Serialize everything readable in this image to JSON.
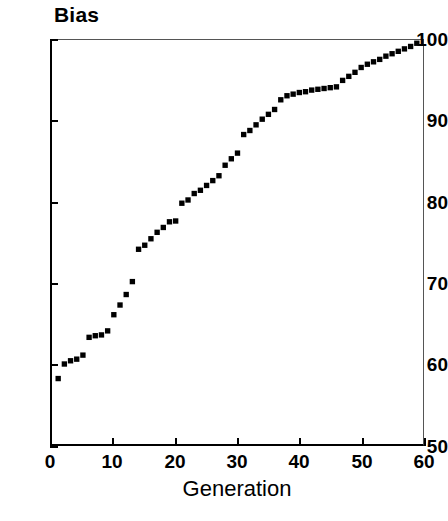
{
  "chart_data": {
    "type": "scatter",
    "title": "Bias",
    "xlabel": "Generation",
    "ylabel": "Bias",
    "xlim": [
      0,
      60
    ],
    "ylim": [
      50,
      100
    ],
    "xticks": [
      0,
      10,
      20,
      30,
      40,
      50,
      60
    ],
    "yticks": [
      50,
      60,
      70,
      80,
      90,
      100
    ],
    "grid": false,
    "legend": null,
    "marker": "square",
    "marker_color": "#000000",
    "series": [
      {
        "name": "Bias",
        "x": [
          1,
          2,
          3,
          4,
          5,
          6,
          7,
          8,
          9,
          10,
          11,
          12,
          13,
          14,
          15,
          16,
          17,
          18,
          19,
          20,
          21,
          22,
          23,
          24,
          25,
          26,
          27,
          28,
          29,
          30,
          31,
          32,
          33,
          34,
          35,
          36,
          37,
          38,
          39,
          40,
          41,
          42,
          43,
          44,
          45,
          46,
          47,
          48,
          49,
          50,
          51,
          52,
          53,
          54,
          55,
          56,
          57,
          58,
          59
        ],
        "values": [
          58.1,
          59.9,
          60.3,
          60.5,
          61.0,
          63.2,
          63.4,
          63.5,
          64.0,
          66.0,
          67.2,
          68.5,
          70.1,
          74.1,
          74.6,
          75.4,
          76.2,
          76.8,
          77.5,
          77.6,
          79.8,
          80.2,
          81.0,
          81.4,
          82.0,
          82.6,
          83.2,
          84.5,
          85.3,
          86.0,
          88.3,
          88.8,
          89.5,
          90.2,
          90.8,
          91.4,
          92.6,
          93.1,
          93.3,
          93.5,
          93.6,
          93.8,
          93.9,
          94.0,
          94.1,
          94.2,
          95.0,
          95.5,
          96.0,
          96.6,
          97.0,
          97.3,
          97.6,
          98.0,
          98.3,
          98.6,
          98.9,
          99.2,
          99.6
        ]
      }
    ]
  },
  "axes": {
    "y_tick_labels": [
      "100",
      "90",
      "80",
      "70",
      "60",
      "50"
    ],
    "x_tick_labels": [
      "0",
      "10",
      "20",
      "30",
      "40",
      "50",
      "60"
    ]
  }
}
